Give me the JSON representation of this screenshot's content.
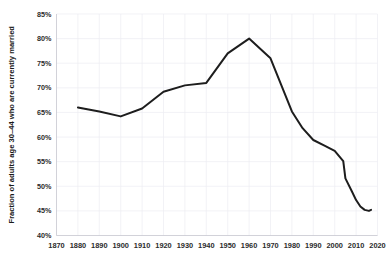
{
  "chart_data": {
    "type": "line",
    "title": "",
    "xlabel": "",
    "ylabel": "Fraction of adults age 30–44  who are currently married",
    "xlim": [
      1870,
      2020
    ],
    "ylim": [
      0.4,
      0.85
    ],
    "grid": true,
    "legend": "none",
    "x_tick_labels": [
      "1870",
      "1880",
      "1890",
      "1900",
      "1910",
      "1920",
      "1930",
      "1940",
      "1950",
      "1960",
      "1970",
      "1980",
      "1990",
      "2000",
      "2010",
      "2020"
    ],
    "x_ticks": [
      1870,
      1880,
      1890,
      1900,
      1910,
      1920,
      1930,
      1940,
      1950,
      1960,
      1970,
      1980,
      1990,
      2000,
      2010,
      2020
    ],
    "y_tick_labels": [
      "40%",
      "45%",
      "50%",
      "55%",
      "60%",
      "65%",
      "70%",
      "75%",
      "80%",
      "85%"
    ],
    "y_ticks": [
      0.4,
      0.45,
      0.5,
      0.55,
      0.6,
      0.65,
      0.7,
      0.75,
      0.8,
      0.85
    ],
    "series": [
      {
        "name": "Fraction currently married",
        "color": "#1d1d1d",
        "x": [
          1880,
          1890,
          1900,
          1910,
          1920,
          1930,
          1940,
          1950,
          1960,
          1970,
          1980,
          1985,
          1990,
          1995,
          2000,
          2004,
          2005,
          2008,
          2010,
          2012,
          2014,
          2016,
          2017
        ],
        "values": [
          0.66,
          0.652,
          0.642,
          0.658,
          0.692,
          0.705,
          0.71,
          0.77,
          0.8,
          0.76,
          0.652,
          0.618,
          0.594,
          0.583,
          0.572,
          0.551,
          0.516,
          0.49,
          0.472,
          0.459,
          0.452,
          0.45,
          0.452
        ]
      }
    ]
  }
}
